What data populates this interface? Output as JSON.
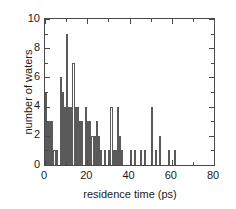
{
  "chart_data": {
    "type": "bar",
    "title": "",
    "subtitle": "",
    "xlabel": "residence time (ps)",
    "ylabel": "number of waters",
    "xlim": [
      0,
      80
    ],
    "ylim": [
      0,
      10
    ],
    "x_major_ticks": [
      0,
      20,
      40,
      60,
      80
    ],
    "x_minor_tick_interval": 10,
    "y_major_ticks": [
      0,
      2,
      4,
      6,
      8,
      10
    ],
    "y_minor_tick_interval": 1,
    "x_tick_labels": [
      "0",
      "20",
      "40",
      "60",
      "80"
    ],
    "y_tick_labels": [
      "0",
      "2",
      "4",
      "6",
      "8",
      "10"
    ],
    "grid": false,
    "legend": false,
    "legend_position": "none",
    "bin_width": 1,
    "bar_fill_color": "#ffffff",
    "bar_edge_color": "#5a5a5a",
    "frame_color": "#4a4a4a",
    "text_color": "#1a1a1a",
    "background_color": "#ffffff",
    "x": [
      0,
      1,
      2,
      3,
      4,
      5,
      6,
      7,
      8,
      9,
      10,
      11,
      12,
      13,
      14,
      15,
      16,
      17,
      18,
      19,
      20,
      21,
      22,
      23,
      24,
      25,
      26,
      27,
      28,
      29,
      30,
      31,
      32,
      33,
      34,
      35,
      36,
      37,
      38,
      39,
      40,
      41,
      42,
      43,
      44,
      45,
      46,
      47,
      48,
      49,
      50,
      51,
      52,
      53,
      54,
      55,
      56,
      57,
      58,
      59,
      60,
      61,
      62,
      63,
      64,
      65,
      66,
      67,
      68,
      69,
      70,
      71,
      72,
      73,
      74,
      75,
      76,
      77,
      78,
      79
    ],
    "values": [
      5,
      3,
      3,
      3,
      1,
      1,
      0,
      6,
      5,
      4,
      9,
      4,
      4,
      7,
      4,
      4,
      3,
      3,
      0,
      4,
      3,
      3,
      2,
      2,
      3,
      2,
      1,
      0,
      1,
      0,
      1,
      4,
      1,
      1,
      4,
      2,
      1,
      0,
      0,
      0,
      1,
      0,
      1,
      0,
      0,
      1,
      0,
      1,
      0,
      0,
      4,
      0,
      1,
      0,
      2,
      0,
      0,
      0,
      1,
      0,
      0,
      1,
      0,
      0,
      0,
      0,
      0,
      0,
      0,
      0,
      0,
      0,
      0,
      0,
      0,
      0,
      0,
      0,
      0,
      0
    ],
    "categories": [
      "0",
      "1",
      "2",
      "3",
      "4",
      "5",
      "6",
      "7",
      "8",
      "9",
      "10",
      "11",
      "12",
      "13",
      "14",
      "15",
      "16",
      "17",
      "18",
      "19",
      "20",
      "21",
      "22",
      "23",
      "24",
      "25",
      "26",
      "27",
      "28",
      "29",
      "30",
      "31",
      "32",
      "33",
      "34",
      "35",
      "36",
      "37",
      "38",
      "39",
      "40",
      "41",
      "42",
      "43",
      "44",
      "45",
      "46",
      "47",
      "48",
      "49",
      "50",
      "51",
      "52",
      "53",
      "54",
      "55",
      "56",
      "57",
      "58",
      "59",
      "60",
      "61",
      "62",
      "63",
      "64",
      "65",
      "66",
      "67",
      "68",
      "69",
      "70",
      "71",
      "72",
      "73",
      "74",
      "75",
      "76",
      "77",
      "78",
      "79"
    ],
    "max_value": 9,
    "annotations": []
  }
}
